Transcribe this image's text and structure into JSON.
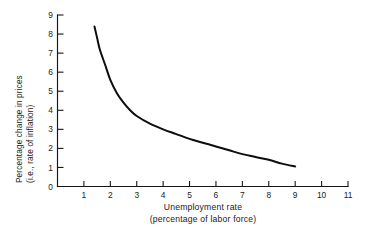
{
  "chart_data": {
    "type": "line",
    "title": "",
    "xlabel": "Unemployment rate",
    "xlabel_line2": "(percentage of labor force)",
    "ylabel": "Percentage change in prices",
    "ylabel_line2": "(i.e., rate of inflation)",
    "xlim": [
      0,
      11
    ],
    "ylim": [
      0,
      9
    ],
    "xticks": [
      0,
      1,
      2,
      3,
      4,
      5,
      6,
      7,
      8,
      9,
      10,
      11
    ],
    "xticklabels": [
      "0",
      "1",
      "2",
      "3",
      "4",
      "5",
      "6",
      "7",
      "8",
      "9",
      "10",
      "11"
    ],
    "yticks": [
      0,
      1,
      2,
      3,
      4,
      5,
      6,
      7,
      8,
      9
    ],
    "yticklabels": [
      "0",
      "1",
      "2",
      "3",
      "4",
      "5",
      "6",
      "7",
      "8",
      "9"
    ],
    "grid": false,
    "legend": false,
    "series": [
      {
        "name": "Phillips curve",
        "x": [
          1.4,
          1.5,
          1.6,
          1.8,
          2.0,
          2.25,
          2.5,
          2.75,
          3.0,
          3.5,
          4.0,
          4.5,
          5.0,
          5.5,
          6.0,
          6.5,
          7.0,
          7.5,
          8.0,
          8.5,
          9.0
        ],
        "y": [
          8.4,
          7.8,
          7.2,
          6.4,
          5.6,
          4.9,
          4.4,
          4.0,
          3.7,
          3.3,
          3.0,
          2.75,
          2.5,
          2.3,
          2.1,
          1.9,
          1.7,
          1.55,
          1.4,
          1.2,
          1.05
        ]
      }
    ],
    "colors": {
      "curve": "#0d0d0d",
      "axis": "#161616",
      "background": "#ffffff",
      "text": "#1a1a1a"
    }
  }
}
